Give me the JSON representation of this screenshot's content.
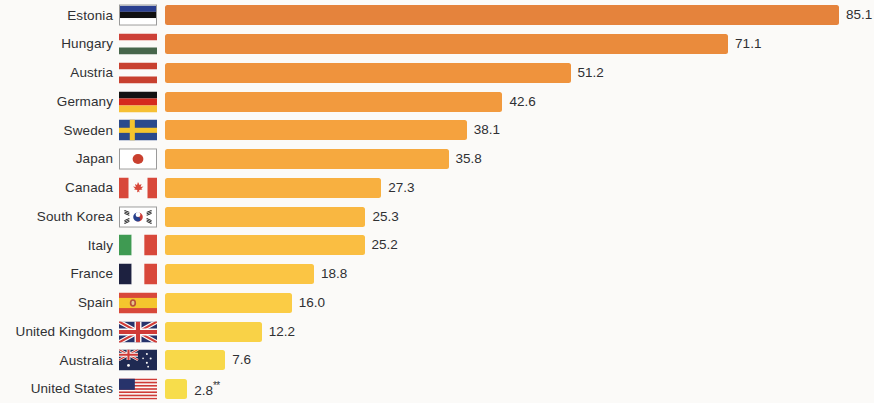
{
  "chart_data": {
    "type": "bar",
    "orientation": "horizontal",
    "title": "",
    "subtitle": "",
    "xlabel": "",
    "ylabel": "",
    "grid": false,
    "legend": "none",
    "xlim": [
      0,
      85.1
    ],
    "categories": [
      "Estonia",
      "Hungary",
      "Austria",
      "Germany",
      "Sweden",
      "Japan",
      "Canada",
      "South Korea",
      "Italy",
      "France",
      "Spain",
      "United Kingdom",
      "Australia",
      "United States"
    ],
    "values": [
      85.1,
      71.1,
      51.2,
      42.6,
      38.1,
      35.8,
      27.3,
      25.3,
      25.2,
      18.8,
      16.0,
      12.2,
      7.6,
      2.8
    ],
    "value_labels": [
      "85.1",
      "71.1",
      "51.2",
      "42.6",
      "38.1",
      "35.8",
      "27.3",
      "25.3",
      "25.2",
      "18.8",
      "16.0",
      "12.2",
      "7.6",
      "2.8"
    ],
    "annotations": [
      {
        "category": "United States",
        "marker": "**"
      }
    ],
    "bar_colors": [
      "#e5833c",
      "#ea8b3c",
      "#ef933d",
      "#f29a3e",
      "#f5a23e",
      "#f6a93f",
      "#f8b040",
      "#f9b741",
      "#fabe42",
      "#fbc544",
      "#fbcc45",
      "#f9d247",
      "#f8d849",
      "#f7dd4b"
    ]
  },
  "rows": [
    {
      "country": "Estonia",
      "value_label": "85.1",
      "footnote": "",
      "flag": "flag-estonia"
    },
    {
      "country": "Hungary",
      "value_label": "71.1",
      "footnote": "",
      "flag": "flag-hungary"
    },
    {
      "country": "Austria",
      "value_label": "51.2",
      "footnote": "",
      "flag": "flag-austria"
    },
    {
      "country": "Germany",
      "value_label": "42.6",
      "footnote": "",
      "flag": "flag-germany"
    },
    {
      "country": "Sweden",
      "value_label": "38.1",
      "footnote": "",
      "flag": "flag-sweden"
    },
    {
      "country": "Japan",
      "value_label": "35.8",
      "footnote": "",
      "flag": "flag-japan"
    },
    {
      "country": "Canada",
      "value_label": "27.3",
      "footnote": "",
      "flag": "flag-canada"
    },
    {
      "country": "South Korea",
      "value_label": "25.3",
      "footnote": "",
      "flag": "flag-south-korea"
    },
    {
      "country": "Italy",
      "value_label": "25.2",
      "footnote": "",
      "flag": "flag-italy"
    },
    {
      "country": "France",
      "value_label": "18.8",
      "footnote": "",
      "flag": "flag-france"
    },
    {
      "country": "Spain",
      "value_label": "16.0",
      "footnote": "",
      "flag": "flag-spain"
    },
    {
      "country": "United Kingdom",
      "value_label": "12.2",
      "footnote": "",
      "flag": "flag-united-kingdom"
    },
    {
      "country": "Australia",
      "value_label": "7.6",
      "footnote": "",
      "flag": "flag-australia"
    },
    {
      "country": "United States",
      "value_label": "2.8",
      "footnote": "**",
      "flag": "flag-united-states"
    }
  ]
}
